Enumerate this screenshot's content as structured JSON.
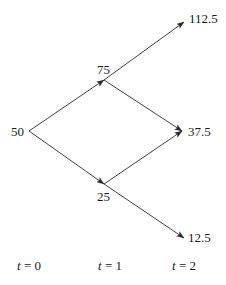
{
  "diagram": {
    "type": "binomial-tree",
    "colors": {
      "line": "#2a2a2a",
      "text": "#1a1a1a",
      "background": "#ffffff"
    },
    "nodes": {
      "root": {
        "label": "50",
        "x": 29,
        "y": 131
      },
      "up": {
        "label": "75",
        "x": 104,
        "y": 80
      },
      "down": {
        "label": "25",
        "x": 104,
        "y": 184
      },
      "up_up": {
        "label": "112.5",
        "x": 184,
        "y": 22
      },
      "up_down": {
        "label": "37.5",
        "x": 182,
        "y": 131
      },
      "down_down": {
        "label": "12.5",
        "x": 184,
        "y": 238
      }
    },
    "edges": [
      {
        "from": "root",
        "to": "up"
      },
      {
        "from": "root",
        "to": "down"
      },
      {
        "from": "up",
        "to": "up_up"
      },
      {
        "from": "up",
        "to": "up_down"
      },
      {
        "from": "down",
        "to": "up_down"
      },
      {
        "from": "down",
        "to": "down_down"
      }
    ],
    "time_labels": [
      {
        "var": "t",
        "eq": " = 0"
      },
      {
        "var": "t",
        "eq": " = 1"
      },
      {
        "var": "t",
        "eq": " = 2"
      }
    ]
  }
}
